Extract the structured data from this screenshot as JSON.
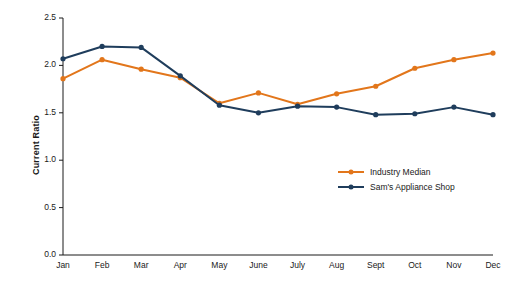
{
  "chart_data": {
    "type": "line",
    "title": "",
    "xlabel": "",
    "ylabel": "Current Ratio",
    "ylim": [
      0.0,
      2.5
    ],
    "yticks": [
      "0.0",
      "0.5",
      "1.0",
      "1.5",
      "2.0",
      "2.5"
    ],
    "grid": false,
    "legend_position": "inside-right",
    "categories": [
      "Jan",
      "Feb",
      "Mar",
      "Apr",
      "May",
      "June",
      "July",
      "Aug",
      "Sept",
      "Oct",
      "Nov",
      "Dec"
    ],
    "series": [
      {
        "name": "Industry Median",
        "color": "#E2761B",
        "values": [
          1.86,
          2.06,
          1.96,
          1.87,
          1.6,
          1.71,
          1.59,
          1.7,
          1.78,
          1.97,
          2.06,
          2.13
        ]
      },
      {
        "name": "Sam's Appliance Shop",
        "color": "#1F3D5C",
        "values": [
          2.07,
          2.2,
          2.19,
          1.89,
          1.58,
          1.5,
          1.57,
          1.56,
          1.48,
          1.49,
          1.56,
          1.48
        ]
      }
    ]
  }
}
